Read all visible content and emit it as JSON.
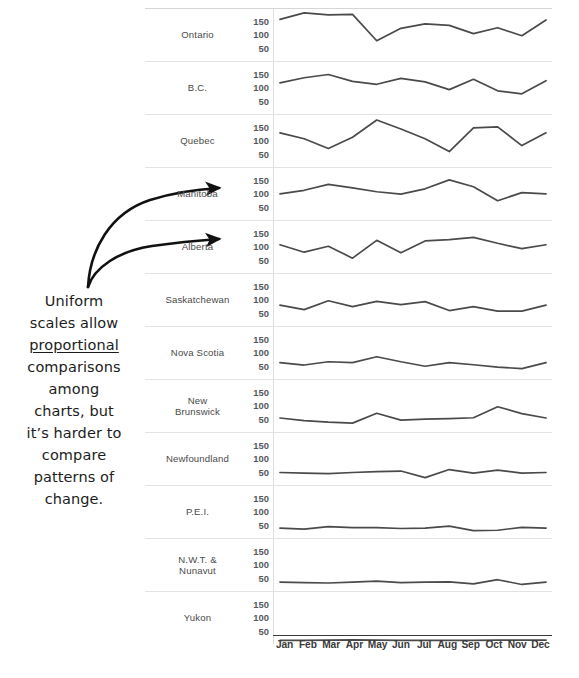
{
  "annotation": {
    "line1": "Uniform",
    "line2": "scales allow",
    "emphasis": "proportional",
    "line3": "comparisons",
    "line4": "among",
    "line5": "charts, but",
    "line6": "it’s harder to",
    "line7": "compare",
    "line8": "patterns of",
    "line9": "change.",
    "full_text": "Uniform scales allow proportional comparisons among charts, but it’s harder to compare patterns of change."
  },
  "arrows": {
    "count": 2,
    "targets": [
      "Manitoba",
      "Alberta"
    ],
    "color": "#111111"
  },
  "axis": {
    "y_ticks": [
      "150",
      "100",
      "50"
    ],
    "y_min": 0,
    "y_max": 175,
    "x_labels": [
      "Jan",
      "Feb",
      "Mar",
      "Apr",
      "May",
      "Jun",
      "Jul",
      "Aug",
      "Sep",
      "Oct",
      "Nov",
      "Dec"
    ]
  },
  "chart_data": {
    "type": "line",
    "title": "",
    "subtitle": "",
    "xlabel": "",
    "ylabel": "",
    "grid": false,
    "legend": "none",
    "layout": "small-multiples, shared uniform y-scale",
    "x": [
      "Jan",
      "Feb",
      "Mar",
      "Apr",
      "May",
      "Jun",
      "Jul",
      "Aug",
      "Sep",
      "Oct",
      "Nov",
      "Dec"
    ],
    "ylim": [
      0,
      175
    ],
    "yticks": [
      50,
      100,
      150
    ],
    "series": [
      {
        "name": "Ontario",
        "values": [
          140,
          162,
          155,
          157,
          68,
          110,
          125,
          120,
          92,
          112,
          85,
          138
        ]
      },
      {
        "name": "B.C.",
        "values": [
          105,
          122,
          133,
          110,
          100,
          120,
          108,
          82,
          117,
          78,
          68,
          112
        ]
      },
      {
        "name": "Quebec",
        "values": [
          115,
          95,
          62,
          100,
          158,
          128,
          95,
          52,
          132,
          135,
          72,
          115
        ]
      },
      {
        "name": "Manitoba",
        "values": [
          88,
          100,
          120,
          108,
          95,
          87,
          105,
          135,
          112,
          65,
          92,
          88
        ]
      },
      {
        "name": "Alberta",
        "values": [
          95,
          70,
          90,
          50,
          110,
          68,
          108,
          112,
          120,
          100,
          82,
          95
        ]
      },
      {
        "name": "Saskatchewan",
        "values": [
          70,
          55,
          85,
          65,
          83,
          72,
          82,
          52,
          65,
          50,
          50,
          70
        ]
      },
      {
        "name": "Nova Scotia",
        "values": [
          55,
          47,
          58,
          55,
          75,
          58,
          43,
          55,
          48,
          40,
          35,
          55
        ]
      },
      {
        "name": "New Brunswick",
        "values": [
          47,
          38,
          33,
          30,
          63,
          40,
          43,
          45,
          48,
          85,
          62,
          47
        ]
      },
      {
        "name": "Newfoundland",
        "values": [
          42,
          40,
          38,
          42,
          45,
          47,
          25,
          52,
          40,
          50,
          40,
          42
        ]
      },
      {
        "name": "P.E.I.",
        "values": [
          33,
          30,
          38,
          35,
          35,
          32,
          33,
          40,
          25,
          26,
          36,
          33
        ]
      },
      {
        "name": "N.W.T. & Nunavut",
        "values": [
          30,
          28,
          27,
          30,
          33,
          28,
          30,
          31,
          24,
          38,
          22,
          30
        ]
      },
      {
        "name": "Yukon",
        "values": [
          12,
          12,
          13,
          14,
          13,
          12,
          12,
          12,
          12,
          13,
          13,
          13
        ]
      }
    ]
  },
  "rows": [
    {
      "label": "Ontario",
      "label_line2": ""
    },
    {
      "label": "B.C.",
      "label_line2": ""
    },
    {
      "label": "Quebec",
      "label_line2": ""
    },
    {
      "label": "Manitoba",
      "label_line2": ""
    },
    {
      "label": "Alberta",
      "label_line2": ""
    },
    {
      "label": "Saskatchewan",
      "label_line2": ""
    },
    {
      "label": "Nova Scotia",
      "label_line2": ""
    },
    {
      "label": "New",
      "label_line2": "Brunswick"
    },
    {
      "label": "Newfoundland",
      "label_line2": ""
    },
    {
      "label": "P.E.I.",
      "label_line2": ""
    },
    {
      "label": "N.W.T. &",
      "label_line2": "Nunavut"
    },
    {
      "label": "Yukon",
      "label_line2": ""
    }
  ],
  "colors": {
    "line": "#4a4a4a",
    "text": "#3b3b3b",
    "tick": "#55585c",
    "rule": "#e3e3e3",
    "axis": "#3a3a3a",
    "ink": "#111111"
  }
}
